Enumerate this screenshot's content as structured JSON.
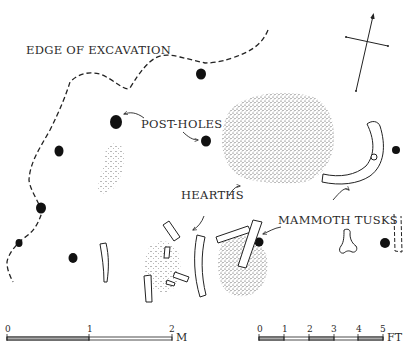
{
  "labels": {
    "edge_of_excavation": "EDGE OF EXCAVATION",
    "post_holes": "POST-HOLES",
    "hearths": "HEARTHS",
    "mammoth_tusks": "MAMMOTH TUSKS"
  },
  "scale_metric": {
    "ticks": [
      "0",
      "1",
      "2"
    ],
    "unit": "M"
  },
  "scale_imperial": {
    "ticks": [
      "0",
      "1",
      "2",
      "3",
      "4",
      "5"
    ],
    "unit": "FT"
  },
  "north_arrow": {
    "icon": "north-arrow-icon"
  },
  "colors": {
    "ink": "#1a1a1a",
    "stipple": "#444444",
    "background": "#ffffff"
  }
}
